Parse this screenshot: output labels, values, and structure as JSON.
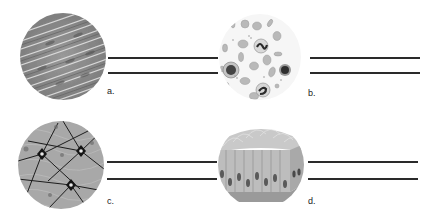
{
  "figure": {
    "panels": [
      {
        "id": "a",
        "label": "a.",
        "icon": "smooth-muscle-tissue-icon",
        "description": "Micrograph: elongated spindle-shaped cells with streaked grey texture",
        "answer_lines": 2
      },
      {
        "id": "b",
        "label": "b.",
        "icon": "blood-tissue-icon",
        "description": "Micrograph: scattered red blood cells and white blood cells with dark lobed nuclei",
        "answer_lines": 2
      },
      {
        "id": "c",
        "label": "c.",
        "icon": "nervous-tissue-icon",
        "description": "Micrograph: neurons with dark star-shaped cell bodies and branching processes",
        "answer_lines": 2
      },
      {
        "id": "d",
        "label": "d.",
        "icon": "ciliated-columnar-epithelium-icon",
        "description": "3D block: tall columnar cells with oval nuclei and cilia on top surface",
        "answer_lines": 2
      }
    ],
    "colors": {
      "line": "#2a2a2a",
      "label": "#222222",
      "background": "#ffffff"
    }
  }
}
